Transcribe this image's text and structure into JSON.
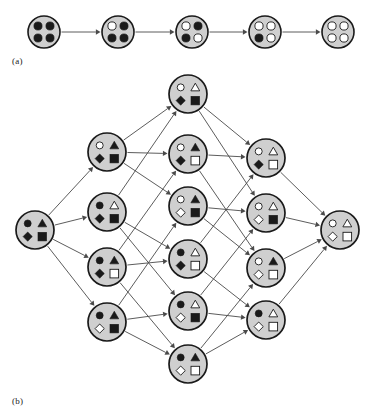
{
  "figure": {
    "panels": [
      {
        "id": "a",
        "label": "(a)",
        "label_x": 12,
        "label_y": 56
      },
      {
        "id": "b",
        "label": "(b)",
        "label_x": 12,
        "label_y": 396
      }
    ]
  },
  "style": {
    "node_fill": "#cfcfcf",
    "node_stroke": "#1a1a1a",
    "glyph_filled": "#1a1a1a",
    "glyph_hollow": "#ffffff",
    "edge_color": "#4a4a4a",
    "background": "#ffffff"
  },
  "glyph_order": [
    "circle",
    "triangle",
    "diamond",
    "square"
  ],
  "panel_a": {
    "caption": "(a)",
    "node_radius": 16,
    "dot_radius": 4.1,
    "nodes": [
      {
        "id": "a0",
        "cx": 44,
        "cy": 32,
        "dots": [
          true,
          true,
          true,
          true
        ]
      },
      {
        "id": "a1",
        "cx": 118,
        "cy": 32,
        "dots": [
          false,
          true,
          true,
          true
        ]
      },
      {
        "id": "a2",
        "cx": 192,
        "cy": 32,
        "dots": [
          false,
          true,
          true,
          false
        ]
      },
      {
        "id": "a3",
        "cx": 265,
        "cy": 32,
        "dots": [
          false,
          false,
          true,
          false
        ]
      },
      {
        "id": "a4",
        "cx": 338,
        "cy": 32,
        "dots": [
          false,
          false,
          false,
          false
        ]
      }
    ],
    "edges": [
      {
        "from": "a0",
        "to": "a1"
      },
      {
        "from": "a1",
        "to": "a2"
      },
      {
        "from": "a2",
        "to": "a3"
      },
      {
        "from": "a3",
        "to": "a4"
      }
    ]
  },
  "panel_b": {
    "caption": "(b)",
    "node_radius": 19,
    "nodes": [
      {
        "id": "s",
        "cx": 35,
        "cy": 230,
        "rank": 4,
        "shapes": {
          "circle": true,
          "triangle": true,
          "diamond": true,
          "square": true
        }
      },
      {
        "id": "c1",
        "cx": 107,
        "cy": 152,
        "rank": 3,
        "shapes": {
          "circle": false,
          "triangle": true,
          "diamond": true,
          "square": true
        }
      },
      {
        "id": "c2",
        "cx": 107,
        "cy": 212,
        "rank": 3,
        "shapes": {
          "circle": true,
          "triangle": false,
          "diamond": true,
          "square": true
        }
      },
      {
        "id": "c3",
        "cx": 107,
        "cy": 267,
        "rank": 3,
        "shapes": {
          "circle": true,
          "triangle": true,
          "diamond": true,
          "square": false
        }
      },
      {
        "id": "c4",
        "cx": 107,
        "cy": 322,
        "rank": 3,
        "shapes": {
          "circle": true,
          "triangle": true,
          "diamond": false,
          "square": true
        }
      },
      {
        "id": "m1",
        "cx": 188,
        "cy": 94,
        "rank": 2,
        "shapes": {
          "circle": false,
          "triangle": false,
          "diamond": true,
          "square": true
        }
      },
      {
        "id": "m2",
        "cx": 188,
        "cy": 154,
        "rank": 2,
        "shapes": {
          "circle": false,
          "triangle": true,
          "diamond": true,
          "square": false
        }
      },
      {
        "id": "m3",
        "cx": 188,
        "cy": 206,
        "rank": 2,
        "shapes": {
          "circle": false,
          "triangle": true,
          "diamond": false,
          "square": true
        }
      },
      {
        "id": "m4",
        "cx": 188,
        "cy": 259,
        "rank": 2,
        "shapes": {
          "circle": true,
          "triangle": false,
          "diamond": true,
          "square": false
        }
      },
      {
        "id": "m5",
        "cx": 188,
        "cy": 311,
        "rank": 2,
        "shapes": {
          "circle": true,
          "triangle": false,
          "diamond": false,
          "square": true
        }
      },
      {
        "id": "m6",
        "cx": 188,
        "cy": 364,
        "rank": 2,
        "shapes": {
          "circle": true,
          "triangle": true,
          "diamond": false,
          "square": false
        }
      },
      {
        "id": "d1",
        "cx": 266,
        "cy": 158,
        "rank": 1,
        "shapes": {
          "circle": false,
          "triangle": false,
          "diamond": true,
          "square": false
        }
      },
      {
        "id": "d2",
        "cx": 266,
        "cy": 213,
        "rank": 1,
        "shapes": {
          "circle": false,
          "triangle": false,
          "diamond": false,
          "square": true
        }
      },
      {
        "id": "d3",
        "cx": 266,
        "cy": 268,
        "rank": 1,
        "shapes": {
          "circle": false,
          "triangle": true,
          "diamond": false,
          "square": false
        }
      },
      {
        "id": "d4",
        "cx": 266,
        "cy": 320,
        "rank": 1,
        "shapes": {
          "circle": true,
          "triangle": false,
          "diamond": false,
          "square": false
        }
      },
      {
        "id": "t",
        "cx": 340,
        "cy": 230,
        "rank": 0,
        "shapes": {
          "circle": false,
          "triangle": false,
          "diamond": false,
          "square": false
        }
      }
    ],
    "edges": [
      {
        "from": "s",
        "to": "c1"
      },
      {
        "from": "s",
        "to": "c2"
      },
      {
        "from": "s",
        "to": "c3"
      },
      {
        "from": "s",
        "to": "c4"
      },
      {
        "from": "c1",
        "to": "m1"
      },
      {
        "from": "c1",
        "to": "m2"
      },
      {
        "from": "c1",
        "to": "m3"
      },
      {
        "from": "c2",
        "to": "m1"
      },
      {
        "from": "c2",
        "to": "m4"
      },
      {
        "from": "c2",
        "to": "m5"
      },
      {
        "from": "c3",
        "to": "m2"
      },
      {
        "from": "c3",
        "to": "m4"
      },
      {
        "from": "c3",
        "to": "m6"
      },
      {
        "from": "c4",
        "to": "m3"
      },
      {
        "from": "c4",
        "to": "m5"
      },
      {
        "from": "c4",
        "to": "m6"
      },
      {
        "from": "m1",
        "to": "d1"
      },
      {
        "from": "m1",
        "to": "d2"
      },
      {
        "from": "m2",
        "to": "d1"
      },
      {
        "from": "m2",
        "to": "d3"
      },
      {
        "from": "m3",
        "to": "d2"
      },
      {
        "from": "m3",
        "to": "d3"
      },
      {
        "from": "m4",
        "to": "d1"
      },
      {
        "from": "m4",
        "to": "d4"
      },
      {
        "from": "m5",
        "to": "d2"
      },
      {
        "from": "m5",
        "to": "d4"
      },
      {
        "from": "m6",
        "to": "d3"
      },
      {
        "from": "m6",
        "to": "d4"
      },
      {
        "from": "d1",
        "to": "t"
      },
      {
        "from": "d2",
        "to": "t"
      },
      {
        "from": "d3",
        "to": "t"
      },
      {
        "from": "d4",
        "to": "t"
      }
    ]
  }
}
